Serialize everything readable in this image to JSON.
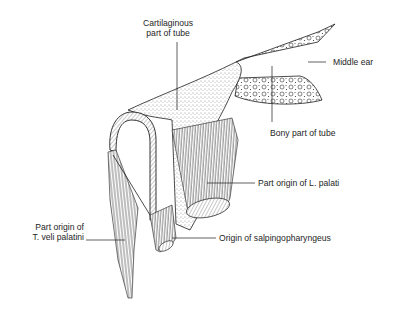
{
  "figure": {
    "colors": {
      "ink": "#1e1e1e",
      "background": "#ffffff",
      "stipple": "#3a3a3a"
    }
  },
  "labels": {
    "cartilaginous_line1": "Cartilaginous",
    "cartilaginous_line2": "part of tube",
    "middle_ear": "Middle ear",
    "bony_part": "Bony part of tube",
    "l_palati": "Part origin of L. palati",
    "t_veli_line1": "Part origin of",
    "t_veli_line2": "T. veli palatini",
    "salpingo": "Origin of salpingopharyngeus"
  }
}
